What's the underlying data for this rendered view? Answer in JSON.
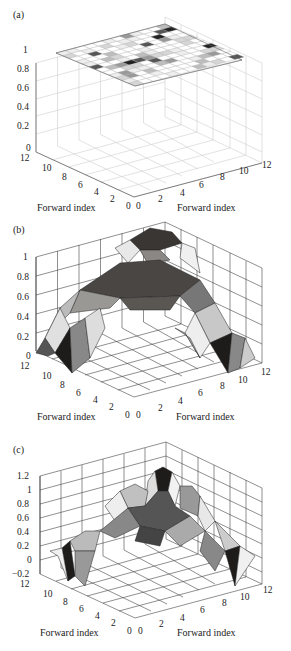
{
  "chart_data": [
    {
      "type": "surface3d",
      "panel": "(a)",
      "title": "",
      "xlabel": "Forward index",
      "ylabel": "Forward index",
      "zlabel": "",
      "x_ticks": [
        "0",
        "2",
        "4",
        "6",
        "8",
        "10",
        "12"
      ],
      "y_ticks": [
        "0",
        "2",
        "4",
        "6",
        "8",
        "10",
        "12"
      ],
      "z_ticks": [
        "0",
        "0.2",
        "0.4",
        "0.6",
        "0.8",
        "1"
      ],
      "zlim": [
        0,
        1
      ],
      "description": "Flat 12x12 plane at z=1 with checkerboard-like grayscale cells",
      "z_constant": 1
    },
    {
      "type": "surface3d",
      "panel": "(b)",
      "title": "",
      "xlabel": "Forward index",
      "ylabel": "Forward index",
      "zlabel": "",
      "x_ticks": [
        "0",
        "2",
        "4",
        "6",
        "8",
        "10",
        "12"
      ],
      "y_ticks": [
        "0",
        "2",
        "4",
        "6",
        "8",
        "10",
        "12"
      ],
      "z_ticks": [
        "0",
        "0.2",
        "0.4",
        "0.6",
        "0.8",
        "1"
      ],
      "zlim": [
        0,
        1
      ],
      "description": "Dome/arch surface peaking near 1 at center, dropping to 0 at corners",
      "z_peak": 1.0,
      "z_min": 0
    },
    {
      "type": "surface3d",
      "panel": "(c)",
      "title": "",
      "xlabel": "Forward index",
      "ylabel": "Forward index",
      "zlabel": "",
      "x_ticks": [
        "0",
        "2",
        "4",
        "6",
        "8",
        "10",
        "12"
      ],
      "y_ticks": [
        "0",
        "2",
        "4",
        "6",
        "8",
        "10",
        "12"
      ],
      "z_ticks": [
        "-0.2",
        "0",
        "0.2",
        "0.4",
        "0.6",
        "0.8",
        "1",
        "1.2"
      ],
      "zlim": [
        -0.2,
        1.2
      ],
      "description": "Multi-peaked surface with central peak near 1.1, side lobes near 0.9, edges dipping to about -0.2",
      "z_peak": 1.1,
      "z_min": -0.2
    }
  ],
  "panels": [
    {
      "label": "(a)",
      "xlabel": "Forward index",
      "ylabel": "Forward index",
      "z_ticks": [
        "1",
        "0.8",
        "0.6",
        "0.4",
        "0.2",
        "0"
      ],
      "left_ticks": [
        "12",
        "10",
        "8",
        "6",
        "4",
        "2",
        "0"
      ],
      "right_ticks": [
        "0",
        "2",
        "4",
        "6",
        "8",
        "10",
        "12"
      ]
    },
    {
      "label": "(b)",
      "xlabel": "Forward index",
      "ylabel": "Forward index",
      "z_ticks": [
        "1",
        "0.8",
        "0.6",
        "0.4",
        "0.2",
        "0"
      ],
      "left_ticks": [
        "12",
        "10",
        "8",
        "6",
        "4",
        "2",
        "0"
      ],
      "right_ticks": [
        "0",
        "2",
        "4",
        "6",
        "8",
        "10",
        "12"
      ]
    },
    {
      "label": "(c)",
      "xlabel": "Forward index",
      "ylabel": "Forward index",
      "z_ticks": [
        "1.2",
        "1",
        "0.8",
        "0.6",
        "0.4",
        "0.2",
        "0",
        "−0.2"
      ],
      "left_ticks": [
        "12",
        "10",
        "8",
        "6",
        "4",
        "2",
        "0"
      ],
      "right_ticks": [
        "0",
        "2",
        "4",
        "6",
        "8",
        "10",
        "12"
      ]
    }
  ]
}
